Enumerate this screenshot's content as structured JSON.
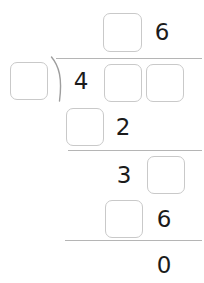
{
  "problem": {
    "type": "long-division",
    "colors": {
      "box_border": "#c9c9c9",
      "rule": "#b5b5b5",
      "digit": "#1b1b1b",
      "background": "#ffffff"
    },
    "quotient": {
      "label": "quotient-row",
      "cells": [
        {
          "kind": "blank",
          "value": ""
        },
        {
          "kind": "digit",
          "value": "6"
        }
      ]
    },
    "divisor": {
      "label": "divisor",
      "cells": [
        {
          "kind": "blank",
          "value": ""
        }
      ]
    },
    "dividend": {
      "label": "dividend-row",
      "cells": [
        {
          "kind": "digit",
          "value": "4"
        },
        {
          "kind": "blank",
          "value": ""
        },
        {
          "kind": "blank",
          "value": ""
        }
      ]
    },
    "steps": [
      {
        "label": "first-partial-product",
        "cells": [
          {
            "kind": "blank",
            "value": ""
          },
          {
            "kind": "digit",
            "value": "2"
          }
        ],
        "rule_after": true
      },
      {
        "label": "first-remainder",
        "cells": [
          {
            "kind": "digit",
            "value": "3"
          },
          {
            "kind": "blank",
            "value": ""
          }
        ],
        "rule_after": false
      },
      {
        "label": "second-partial-product",
        "cells": [
          {
            "kind": "blank",
            "value": ""
          },
          {
            "kind": "digit",
            "value": "6"
          }
        ],
        "rule_after": true
      }
    ],
    "remainder": {
      "label": "final-remainder",
      "cells": [
        {
          "kind": "digit",
          "value": "0"
        }
      ]
    }
  }
}
